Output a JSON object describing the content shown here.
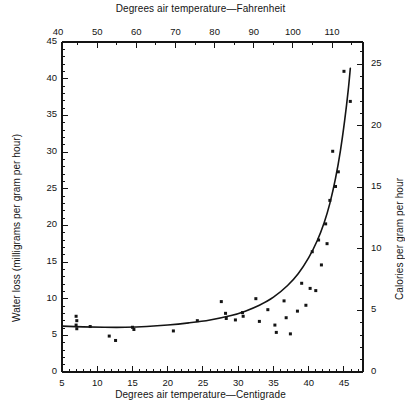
{
  "figure": {
    "background": "#ffffff",
    "ink_color": "#141414",
    "plot_box": {
      "left": 62,
      "right": 363,
      "top": 42,
      "bottom": 372
    }
  },
  "chart_data": {
    "type": "scatter",
    "title": "",
    "xlabel": "Degrees air temperature—Centigrade",
    "ylabel": "Water loss (milligrams per gram per hour)",
    "top_axis_label": "Degrees air temperature—Fahrenheit",
    "right_axis_label": "Calories per gram per hour",
    "xlim": [
      5,
      47.7
    ],
    "ylim": [
      0,
      45
    ],
    "top_xlim": [
      41,
      117.9
    ],
    "right_ylim": [
      0,
      26.8
    ],
    "grid": false,
    "legend": null,
    "x_ticks_major": [
      5,
      10,
      15,
      20,
      25,
      30,
      35,
      40,
      45
    ],
    "x_tick_labels": [
      "5",
      "10",
      "15",
      "20",
      "25",
      "30",
      "35",
      "40",
      "45"
    ],
    "x_tick_step_minor": 1,
    "y_ticks_major": [
      0,
      5,
      10,
      15,
      20,
      25,
      30,
      35,
      40,
      45
    ],
    "y_tick_labels": [
      "0",
      "5",
      "10",
      "15",
      "20",
      "25",
      "30",
      "35",
      "40",
      "45"
    ],
    "y_tick_step_minor": 1,
    "top_ticks_major": [
      40,
      50,
      60,
      70,
      80,
      90,
      100,
      110
    ],
    "top_tick_labels": [
      "40",
      "50",
      "60",
      "70",
      "80",
      "90",
      "100",
      "110"
    ],
    "top_tick_step_minor": 5,
    "right_ticks_major": [
      0,
      5,
      10,
      15,
      20,
      25
    ],
    "right_tick_labels": [
      "0",
      "5",
      "10",
      "15",
      "20",
      "25"
    ],
    "right_tick_step_minor": 1,
    "marker": "filled-square",
    "marker_size_px": 3,
    "points": [
      [
        7.0,
        7.6
      ],
      [
        7.1,
        7.0
      ],
      [
        7.0,
        6.4
      ],
      [
        7.1,
        5.9
      ],
      [
        9.0,
        6.2
      ],
      [
        11.7,
        4.9
      ],
      [
        12.6,
        4.3
      ],
      [
        15.0,
        6.1
      ],
      [
        15.2,
        5.8
      ],
      [
        20.8,
        5.6
      ],
      [
        24.2,
        7.0
      ],
      [
        27.6,
        9.6
      ],
      [
        28.2,
        8.0
      ],
      [
        28.3,
        7.3
      ],
      [
        29.6,
        7.1
      ],
      [
        30.6,
        8.1
      ],
      [
        30.7,
        7.6
      ],
      [
        32.5,
        10.0
      ],
      [
        33.0,
        6.9
      ],
      [
        34.2,
        8.5
      ],
      [
        35.2,
        6.4
      ],
      [
        35.4,
        5.4
      ],
      [
        36.5,
        9.7
      ],
      [
        36.8,
        7.4
      ],
      [
        37.4,
        5.2
      ],
      [
        38.4,
        8.3
      ],
      [
        39.0,
        12.1
      ],
      [
        39.6,
        9.1
      ],
      [
        40.2,
        11.4
      ],
      [
        40.5,
        16.4
      ],
      [
        41.0,
        11.1
      ],
      [
        41.4,
        18.0
      ],
      [
        41.8,
        14.6
      ],
      [
        42.4,
        20.2
      ],
      [
        42.6,
        17.5
      ],
      [
        43.0,
        23.4
      ],
      [
        43.4,
        30.1
      ],
      [
        43.8,
        25.3
      ],
      [
        44.2,
        27.3
      ],
      [
        45.0,
        41.0
      ],
      [
        45.9,
        36.9
      ]
    ],
    "fitted_curve": {
      "description": "smooth exponential-like fit",
      "points": [
        [
          5.0,
          6.25
        ],
        [
          8.0,
          6.15
        ],
        [
          11.0,
          6.1
        ],
        [
          14.0,
          6.1
        ],
        [
          17.0,
          6.2
        ],
        [
          20.0,
          6.4
        ],
        [
          23.0,
          6.7
        ],
        [
          26.0,
          7.1
        ],
        [
          29.0,
          7.7
        ],
        [
          31.0,
          8.3
        ],
        [
          33.0,
          9.1
        ],
        [
          35.0,
          10.2
        ],
        [
          37.0,
          11.8
        ],
        [
          38.5,
          13.4
        ],
        [
          40.0,
          15.6
        ],
        [
          41.2,
          17.9
        ],
        [
          42.2,
          20.4
        ],
        [
          43.0,
          23.0
        ],
        [
          43.8,
          26.4
        ],
        [
          44.5,
          30.2
        ],
        [
          45.1,
          34.3
        ],
        [
          45.6,
          38.4
        ],
        [
          45.9,
          41.4
        ]
      ]
    }
  }
}
